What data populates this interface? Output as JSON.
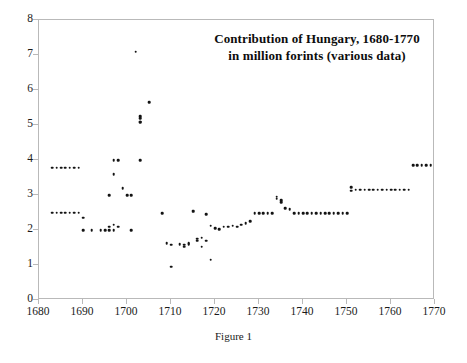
{
  "chart_data": {
    "type": "scatter",
    "title": "Contribution of Hungary, 1680-1770 in million forints (various data)",
    "title_lines": [
      "Contribution of Hungary, 1680-1770",
      "in million forints (various data)"
    ],
    "caption": "Figure 1",
    "xlabel": "",
    "ylabel": "",
    "xlim": [
      1680,
      1770
    ],
    "ylim": [
      0,
      8
    ],
    "xticks": [
      1680,
      1690,
      1700,
      1710,
      1720,
      1730,
      1740,
      1750,
      1760,
      1770
    ],
    "yticks": [
      0,
      1,
      2,
      3,
      4,
      5,
      6,
      7,
      8
    ],
    "grid": false,
    "legend": null,
    "marker_color": "#131313",
    "frame_color": "#b9b9b9",
    "series": [
      {
        "name": "Contribution of Hungary (million forints)",
        "x": [
          1683,
          1684,
          1685,
          1686,
          1687,
          1688,
          1689,
          1683,
          1684,
          1685,
          1686,
          1687,
          1688,
          1689,
          1690,
          1690,
          1692,
          1694,
          1695,
          1696,
          1696,
          1697,
          1697,
          1696,
          1697,
          1697,
          1698,
          1698,
          1699,
          1700,
          1701,
          1701,
          1702,
          1703,
          1703,
          1703,
          1703,
          1703,
          1705,
          1708,
          1709,
          1710,
          1710,
          1712,
          1713,
          1713,
          1714,
          1714,
          1715,
          1715,
          1716,
          1716,
          1717,
          1717,
          1718,
          1718,
          1719,
          1719,
          1720,
          1721,
          1722,
          1723,
          1724,
          1725,
          1726,
          1727,
          1728,
          1729,
          1730,
          1731,
          1732,
          1733,
          1734,
          1734,
          1735,
          1735,
          1736,
          1737,
          1738,
          1739,
          1740,
          1741,
          1742,
          1743,
          1744,
          1745,
          1746,
          1747,
          1748,
          1749,
          1750,
          1751,
          1751,
          1752,
          1753,
          1754,
          1755,
          1756,
          1757,
          1758,
          1759,
          1760,
          1761,
          1762,
          1763,
          1764,
          1765,
          1766,
          1767,
          1768,
          1769
        ],
        "y": [
          3.78,
          3.78,
          3.78,
          3.78,
          3.78,
          3.78,
          3.78,
          2.5,
          2.5,
          2.5,
          2.5,
          2.5,
          2.5,
          2.5,
          2.35,
          2.0,
          2.0,
          2.0,
          2.0,
          2.0,
          2.1,
          2.15,
          2.0,
          3.0,
          4.0,
          3.6,
          4.0,
          2.1,
          3.2,
          3.0,
          3.0,
          2.0,
          7.1,
          5.25,
          5.2,
          5.1,
          5.08,
          4.0,
          5.65,
          2.48,
          1.62,
          1.58,
          0.95,
          1.6,
          1.58,
          1.52,
          1.6,
          1.62,
          2.55,
          2.52,
          1.7,
          1.75,
          1.78,
          1.52,
          2.45,
          1.7,
          2.12,
          1.15,
          2.05,
          2.02,
          2.1,
          2.1,
          2.12,
          2.1,
          2.15,
          2.2,
          2.25,
          2.48,
          2.48,
          2.48,
          2.48,
          2.48,
          2.95,
          2.9,
          2.85,
          2.8,
          2.62,
          2.6,
          2.48,
          2.48,
          2.48,
          2.48,
          2.48,
          2.48,
          2.48,
          2.48,
          2.48,
          2.48,
          2.48,
          2.48,
          2.48,
          3.22,
          3.12,
          3.15,
          3.15,
          3.15,
          3.15,
          3.15,
          3.15,
          3.15,
          3.15,
          3.15,
          3.15,
          3.15,
          3.15,
          3.15,
          3.85,
          3.85,
          3.85,
          3.85,
          3.85
        ]
      }
    ]
  }
}
